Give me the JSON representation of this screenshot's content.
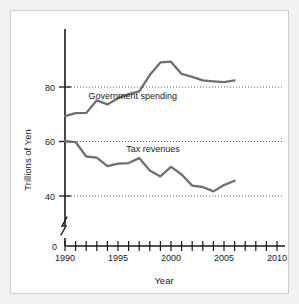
{
  "chart_data": {
    "type": "line",
    "title": "",
    "xlabel": "Year",
    "ylabel": "Trillions of Yen",
    "xlim": [
      1990,
      2010
    ],
    "ylim": [
      0,
      95
    ],
    "grid": true,
    "grid_values": [
      40,
      60,
      80
    ],
    "legend": "inline-labels",
    "y_axis_break": true,
    "y_ticks": [
      0,
      40,
      60,
      80
    ],
    "y_tick_labels": [
      "0",
      "40",
      "60",
      "80"
    ],
    "x_ticks": [
      1990,
      1991,
      1992,
      1993,
      1994,
      1995,
      1996,
      1997,
      1998,
      1999,
      2000,
      2001,
      2002,
      2003,
      2004,
      2005,
      2006,
      2007,
      2008,
      2009,
      2010
    ],
    "x_tick_labels": [
      "1990",
      "1995",
      "2000",
      "2005",
      "2010"
    ],
    "x_labeled_ticks": [
      1990,
      1995,
      2000,
      2005,
      2010
    ],
    "x": [
      1990,
      1991,
      1992,
      1993,
      1994,
      1995,
      1996,
      1997,
      1998,
      1999,
      2000,
      2001,
      2002,
      2003,
      2004,
      2005,
      2006
    ],
    "series": [
      {
        "name": "Government spending",
        "color": "#6f6f6f",
        "label_x": 1996.4,
        "label_y": 75.6,
        "values": [
          69.3,
          70.4,
          70.5,
          75.1,
          73.6,
          75.9,
          77.4,
          78.4,
          84.4,
          89.0,
          89.3,
          84.8,
          83.7,
          82.4,
          82.1,
          81.8,
          82.4
        ]
      },
      {
        "name": "Tax revenues",
        "color": "#6f6f6f",
        "label_x": 1998.3,
        "label_y": 56.0,
        "values": [
          60.1,
          59.8,
          54.5,
          54.1,
          51.0,
          51.9,
          52.1,
          53.9,
          49.4,
          47.2,
          50.7,
          47.9,
          43.8,
          43.3,
          41.7,
          44.0,
          45.6
        ]
      }
    ]
  }
}
